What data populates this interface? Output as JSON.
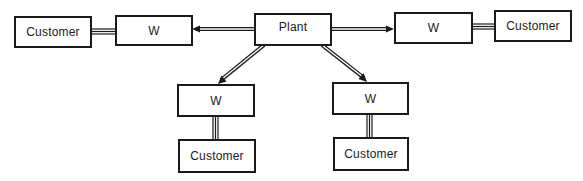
{
  "diagram": {
    "colors": {
      "stroke": "#1a1a1a",
      "background": "#ffffff"
    },
    "nodes": {
      "plant": {
        "label": "Plant"
      },
      "w_left": {
        "label": "W"
      },
      "w_right": {
        "label": "W"
      },
      "w_bottom_left": {
        "label": "W"
      },
      "w_bottom_right": {
        "label": "W"
      },
      "customer_left": {
        "label": "Customer"
      },
      "customer_right": {
        "label": "Customer"
      },
      "customer_bottom_left": {
        "label": "Customer"
      },
      "customer_bottom_right": {
        "label": "Customer"
      }
    },
    "edges": [
      {
        "from": "plant",
        "to": "w_left",
        "type": "arrow"
      },
      {
        "from": "plant",
        "to": "w_right",
        "type": "arrow"
      },
      {
        "from": "plant",
        "to": "w_bottom_left",
        "type": "arrow"
      },
      {
        "from": "plant",
        "to": "w_bottom_right",
        "type": "arrow"
      },
      {
        "from": "w_left",
        "to": "customer_left",
        "type": "triple-line"
      },
      {
        "from": "w_right",
        "to": "customer_right",
        "type": "triple-line"
      },
      {
        "from": "w_bottom_left",
        "to": "customer_bottom_left",
        "type": "triple-line"
      },
      {
        "from": "w_bottom_right",
        "to": "customer_bottom_right",
        "type": "triple-line"
      }
    ]
  }
}
